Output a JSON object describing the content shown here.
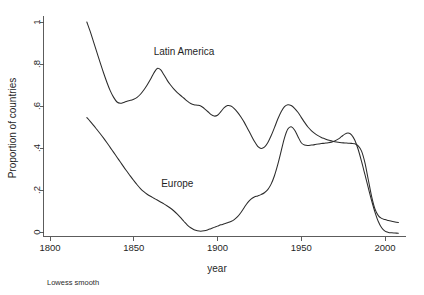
{
  "chart_data": {
    "type": "line",
    "title": "",
    "xlabel": "year",
    "ylabel": "Proportion of countries",
    "note": "Lowess smooth",
    "xlim": [
      1790,
      2012
    ],
    "ylim": [
      0,
      1
    ],
    "xticks": [
      1800,
      1850,
      1900,
      1950,
      2000
    ],
    "xtick_labels": [
      "1800",
      "1850",
      "1900",
      "1950",
      "2000"
    ],
    "yticks": [
      0,
      0.2,
      0.4,
      0.6,
      0.8,
      1
    ],
    "ytick_labels": [
      "0",
      ".2",
      ".4",
      ".6",
      ".8",
      "1"
    ],
    "grid": false,
    "legend_position": "inline-annotation",
    "line_color": "#2b2b2b",
    "series": [
      {
        "name": "Latin America",
        "label_x": 1880,
        "label_y": 0.845,
        "x": [
          1822,
          1824,
          1826,
          1828,
          1830,
          1832,
          1834,
          1836,
          1838,
          1840,
          1842,
          1844,
          1846,
          1848,
          1850,
          1852,
          1854,
          1856,
          1858,
          1860,
          1862,
          1864,
          1866,
          1868,
          1870,
          1872,
          1874,
          1876,
          1878,
          1880,
          1882,
          1884,
          1886,
          1888,
          1890,
          1892,
          1894,
          1896,
          1898,
          1900,
          1902,
          1904,
          1906,
          1908,
          1910,
          1912,
          1914,
          1916,
          1918,
          1920,
          1922,
          1924,
          1926,
          1928,
          1930,
          1932,
          1934,
          1936,
          1938,
          1940,
          1942,
          1944,
          1946,
          1948,
          1950,
          1952,
          1954,
          1956,
          1958,
          1960,
          1962,
          1964,
          1966,
          1968,
          1970,
          1972,
          1974,
          1976,
          1978,
          1980,
          1982,
          1984,
          1986,
          1988,
          1990,
          1992,
          1994,
          1996,
          1998,
          2000,
          2002,
          2004,
          2006,
          2008
        ],
        "y": [
          1.0,
          0.955,
          0.905,
          0.855,
          0.805,
          0.757,
          0.712,
          0.672,
          0.641,
          0.619,
          0.613,
          0.617,
          0.623,
          0.627,
          0.632,
          0.641,
          0.656,
          0.676,
          0.7,
          0.727,
          0.757,
          0.779,
          0.773,
          0.749,
          0.722,
          0.7,
          0.68,
          0.664,
          0.65,
          0.637,
          0.623,
          0.612,
          0.606,
          0.604,
          0.6,
          0.589,
          0.575,
          0.56,
          0.552,
          0.556,
          0.573,
          0.592,
          0.602,
          0.6,
          0.588,
          0.57,
          0.548,
          0.522,
          0.492,
          0.462,
          0.432,
          0.408,
          0.398,
          0.404,
          0.425,
          0.458,
          0.497,
          0.538,
          0.573,
          0.597,
          0.606,
          0.602,
          0.589,
          0.57,
          0.546,
          0.522,
          0.5,
          0.483,
          0.47,
          0.459,
          0.45,
          0.444,
          0.438,
          0.434,
          0.43,
          0.427,
          0.425,
          0.424,
          0.423,
          0.422,
          0.42,
          0.41,
          0.385,
          0.33,
          0.25,
          0.17,
          0.11,
          0.078,
          0.065,
          0.059,
          0.055,
          0.051,
          0.048,
          0.045
        ]
      },
      {
        "name": "Europe",
        "label_x": 1876,
        "label_y": 0.215,
        "x": [
          1822,
          1824,
          1826,
          1828,
          1830,
          1832,
          1834,
          1836,
          1838,
          1840,
          1842,
          1844,
          1846,
          1848,
          1850,
          1852,
          1854,
          1856,
          1858,
          1860,
          1862,
          1864,
          1866,
          1868,
          1870,
          1872,
          1874,
          1876,
          1878,
          1880,
          1882,
          1884,
          1886,
          1888,
          1890,
          1892,
          1894,
          1896,
          1898,
          1900,
          1902,
          1904,
          1906,
          1908,
          1910,
          1912,
          1914,
          1916,
          1918,
          1920,
          1922,
          1924,
          1926,
          1928,
          1930,
          1932,
          1934,
          1936,
          1938,
          1940,
          1942,
          1944,
          1946,
          1948,
          1950,
          1952,
          1954,
          1956,
          1958,
          1960,
          1962,
          1964,
          1966,
          1968,
          1970,
          1972,
          1974,
          1976,
          1978,
          1980,
          1982,
          1984,
          1986,
          1988,
          1990,
          1992,
          1994,
          1996,
          1998,
          2000,
          2002,
          2004,
          2006,
          2008
        ],
        "y": [
          0.545,
          0.527,
          0.508,
          0.488,
          0.468,
          0.447,
          0.425,
          0.402,
          0.379,
          0.356,
          0.333,
          0.31,
          0.288,
          0.266,
          0.245,
          0.225,
          0.207,
          0.192,
          0.18,
          0.17,
          0.161,
          0.152,
          0.143,
          0.134,
          0.124,
          0.113,
          0.1,
          0.085,
          0.068,
          0.05,
          0.033,
          0.02,
          0.011,
          0.006,
          0.004,
          0.006,
          0.01,
          0.016,
          0.022,
          0.028,
          0.034,
          0.039,
          0.044,
          0.05,
          0.059,
          0.073,
          0.093,
          0.117,
          0.14,
          0.157,
          0.167,
          0.172,
          0.178,
          0.187,
          0.202,
          0.228,
          0.268,
          0.322,
          0.385,
          0.448,
          0.49,
          0.501,
          0.486,
          0.455,
          0.425,
          0.414,
          0.412,
          0.414,
          0.416,
          0.419,
          0.421,
          0.423,
          0.425,
          0.428,
          0.433,
          0.442,
          0.454,
          0.466,
          0.471,
          0.463,
          0.437,
          0.393,
          0.336,
          0.274,
          0.211,
          0.15,
          0.095,
          0.05,
          0.02,
          0.004,
          -0.002,
          -0.004,
          -0.005,
          -0.006
        ]
      }
    ]
  }
}
